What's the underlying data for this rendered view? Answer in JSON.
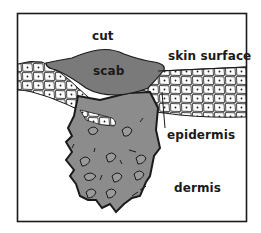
{
  "figure": {
    "type": "cross-section illustration of a skin cut",
    "colors": {
      "background": "#ffffff",
      "outline": "#1a1a1a",
      "scab_fill": "#7a7a7a",
      "wound_fill": "#8c8c8c",
      "cell_fill": "#ffffff"
    }
  },
  "labels": {
    "cut": "cut",
    "scab": "scab",
    "skin_surface": "skin surface",
    "epidermis": "epidermis",
    "dermis": "dermis"
  }
}
